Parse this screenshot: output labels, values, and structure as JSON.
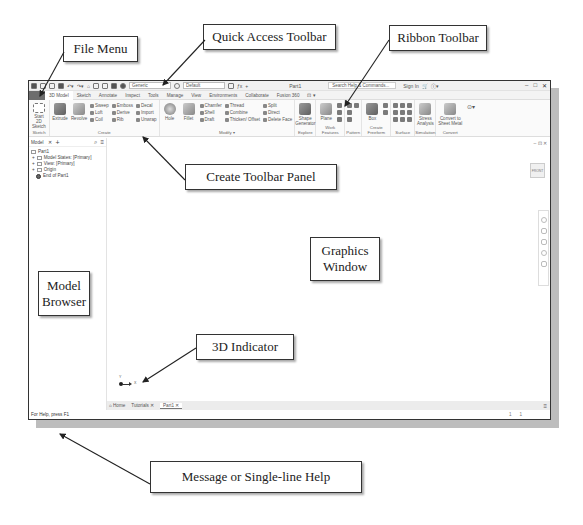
{
  "callouts": {
    "file_menu": "File Menu",
    "quick_access": "Quick Access Toolbar",
    "ribbon": "Ribbon Toolbar",
    "create_panel": "Create Toolbar Panel",
    "graphics": "Graphics Window",
    "model_browser": "Model Browser",
    "indicator": "3D Indicator",
    "message": "Message or Single-line Help"
  },
  "qat": {
    "material": "Generic",
    "appearance": "Default",
    "doc_title": "Part1",
    "search_placeholder": "Search Help & Commands...",
    "sign_in": "Sign In",
    "minimize": "–",
    "maximize": "□",
    "close": "✕"
  },
  "tabs": [
    {
      "label": ""
    },
    {
      "label": "3D Model"
    },
    {
      "label": "Sketch"
    },
    {
      "label": "Annotate"
    },
    {
      "label": "Inspect"
    },
    {
      "label": "Tools"
    },
    {
      "label": "Manage"
    },
    {
      "label": "View"
    },
    {
      "label": "Environments"
    },
    {
      "label": "Collaborate"
    },
    {
      "label": "Fusion 360"
    },
    {
      "label": "⊡ ▾"
    }
  ],
  "ribbon": {
    "sketch": {
      "title": "Sketch",
      "start": "Start 2D Sketch"
    },
    "create": {
      "title": "Create",
      "extrude": "Extrude",
      "revolve": "Revolve",
      "sweep": "Sweep",
      "loft": "Loft",
      "coil": "Coil",
      "emboss": "Emboss",
      "derive": "Derive",
      "rib": "Rib",
      "decal": "Decal",
      "import": "Import",
      "unwrap": "Unwrap"
    },
    "modify": {
      "title": "Modify ▾",
      "hole": "Hole",
      "fillet": "Fillet",
      "chamfer": "Chamfer",
      "shell": "Shell",
      "draft": "Draft",
      "thread": "Thread",
      "combine": "Combine",
      "thicken": "Thicken/ Offset",
      "split": "Split",
      "direct": "Direct",
      "delete_face": "Delete Face"
    },
    "explore": {
      "title": "Explore",
      "shape_generator": "Shape Generator"
    },
    "work_features": {
      "title": "Work Features",
      "plane": "Plane"
    },
    "pattern": {
      "title": "Pattern"
    },
    "create_freeform": {
      "title": "Create Freeform",
      "box": "Box"
    },
    "surface": {
      "title": "Surface"
    },
    "simulation": {
      "title": "Simulation",
      "stress": "Stress Analysis"
    },
    "convert": {
      "title": "Convert",
      "sheet_metal": "Convert to Sheet Metal"
    }
  },
  "browser": {
    "tab": "Model",
    "close": "✕",
    "add": "+",
    "search": "⌕",
    "menu": "≡",
    "nodes": [
      {
        "label": "Part1",
        "indent": 0
      },
      {
        "label": "Model States: [Primary]",
        "indent": 1
      },
      {
        "label": "View: [Primary]",
        "indent": 1
      },
      {
        "label": "Origin",
        "indent": 1
      },
      {
        "label": "End of Part1",
        "indent": 2
      }
    ]
  },
  "graphics": {
    "viewcube": "FRONT",
    "window_controls": "– ⊡ ✕",
    "axis_x": "X",
    "axis_y": "Y"
  },
  "doctabs": {
    "home": "⌂ Home",
    "tutorials": "Tutorials ✕",
    "part1": "Part1 ✕",
    "menu": "≡"
  },
  "status": {
    "message": "For Help, press F1",
    "num1": "1",
    "num2": "1"
  }
}
